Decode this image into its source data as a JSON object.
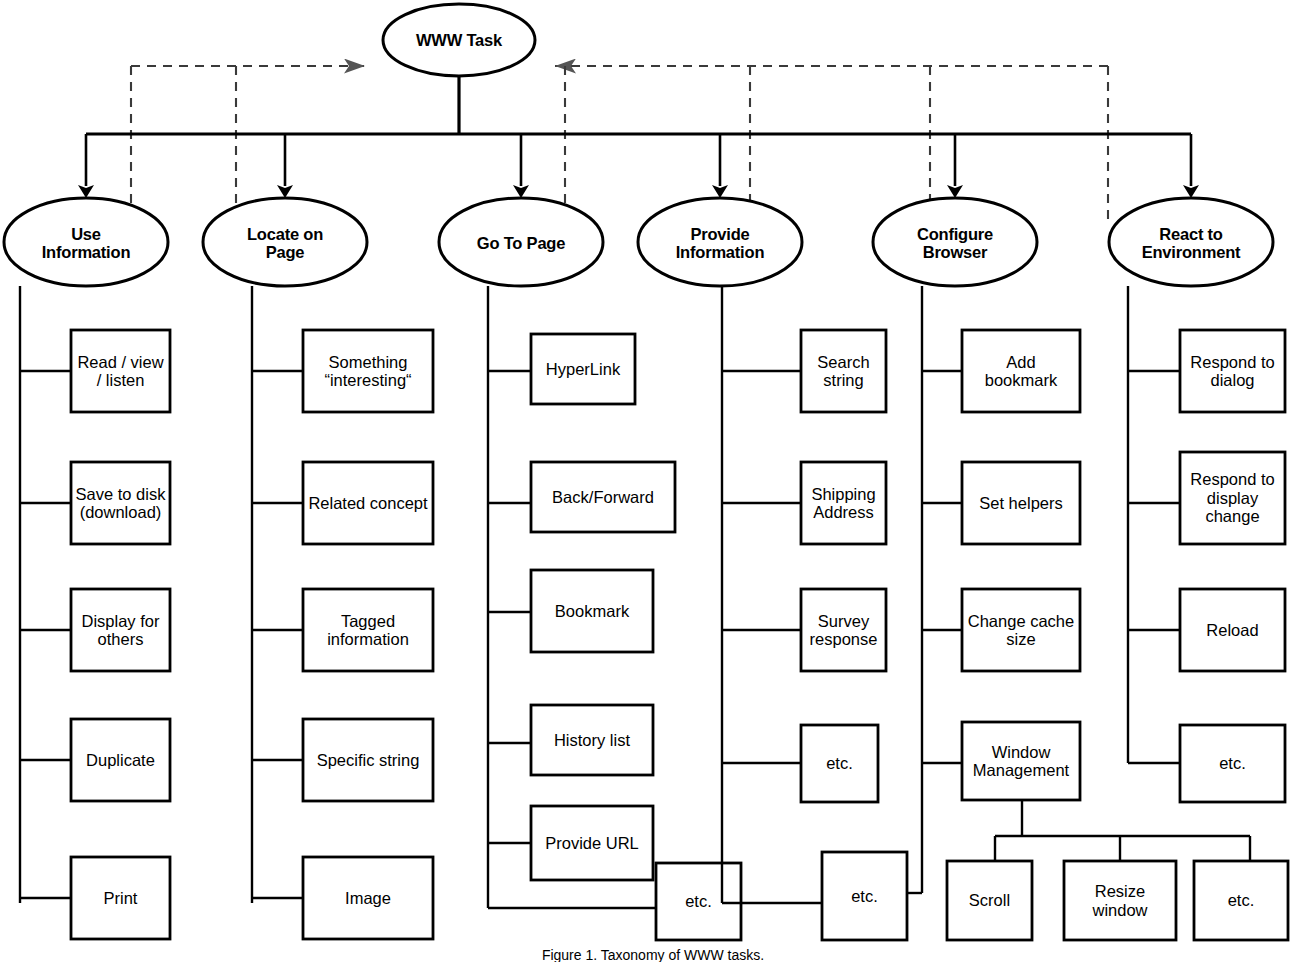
{
  "figure": {
    "caption": "Figure 1. Taxonomy of WWW tasks.",
    "root": {
      "label": "WWW Task",
      "shape": "ellipse"
    }
  },
  "colors": {
    "stroke": "#000000",
    "background": "#ffffff",
    "dashed": "#000000"
  },
  "branches": [
    {
      "id": "use-information",
      "label": "Use\nInformation",
      "items": [
        "Read / view\n/ listen",
        "Save to disk\n(download)",
        "Display for\nothers",
        "Duplicate",
        "Print"
      ]
    },
    {
      "id": "locate-on-page",
      "label": "Locate on\nPage",
      "items": [
        "Something\n“interesting“",
        "Related concept",
        "Tagged\ninformation",
        "Specific string",
        "Image"
      ]
    },
    {
      "id": "go-to-page",
      "label": "Go To Page",
      "items": [
        "HyperLink",
        "Back/Forward",
        "Bookmark",
        "History list",
        "Provide URL",
        "etc."
      ]
    },
    {
      "id": "provide-information",
      "label": "Provide\nInformation",
      "items": [
        "Search\nstring",
        "Shipping\nAddress",
        "Survey\nresponse",
        "etc."
      ]
    },
    {
      "id": "configure-browser",
      "label": "Configure\nBrowser",
      "items": [
        "Add\nbookmark",
        "Set helpers",
        "Change cache\nsize",
        "Window\nManagement",
        "etc."
      ],
      "subgroup": {
        "parent": "Window\nManagement",
        "items": [
          "Scroll",
          "Resize\nwindow",
          "etc."
        ]
      }
    },
    {
      "id": "react-to-environment",
      "label": "React to\nEnvironment",
      "items": [
        "Respond to\ndialog",
        "Respond to\ndisplay\nchange",
        "Reload",
        "etc."
      ]
    }
  ]
}
